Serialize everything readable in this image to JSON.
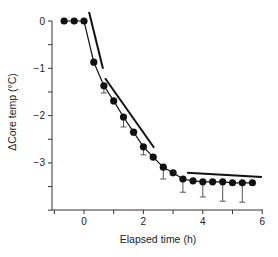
{
  "chart_data": {
    "type": "line",
    "title": "",
    "xlabel": "Elapsed time (h)",
    "ylabel": "ΔCore temp (°C)",
    "xlim": [
      -1,
      6
    ],
    "ylim": [
      -4,
      0.1
    ],
    "x_ticks": [
      -1,
      0,
      1,
      2,
      3,
      4,
      5,
      6
    ],
    "x_tick_labels": [
      "",
      "0",
      "",
      "2",
      "",
      "4",
      "",
      "6"
    ],
    "y_ticks": [
      0,
      -0.5,
      -1,
      -1.5,
      -2,
      -2.5,
      -3,
      -3.5,
      -4
    ],
    "y_tick_labels": [
      "0",
      "",
      "-1",
      "",
      "-2",
      "",
      "-3",
      "",
      ""
    ],
    "grid": false,
    "legend": null,
    "series": [
      {
        "name": "Core temperature change",
        "marker": "filled-circle",
        "x": [
          -0.67,
          -0.33,
          0,
          0.33,
          0.67,
          1.0,
          1.33,
          1.67,
          2.0,
          2.33,
          2.67,
          3.0,
          3.33,
          3.67,
          4.0,
          4.33,
          4.67,
          5.0,
          5.33,
          5.67
        ],
        "values": [
          0,
          0,
          0,
          -0.87,
          -1.37,
          -1.69,
          -2.03,
          -2.35,
          -2.66,
          -2.88,
          -3.09,
          -3.21,
          -3.34,
          -3.38,
          -3.4,
          -3.4,
          -3.4,
          -3.42,
          -3.42,
          -3.42
        ],
        "error_lower": [
          0,
          0,
          0,
          0,
          0.15,
          0,
          0.21,
          0,
          0.17,
          0,
          0.25,
          0,
          0.28,
          0,
          0.32,
          0,
          0.41,
          0,
          0.41,
          0
        ]
      }
    ],
    "annotations": [
      {
        "type": "fit-line",
        "phase": 1,
        "x": [
          0.17,
          0.64
        ],
        "y": [
          0.19,
          -1.01
        ]
      },
      {
        "type": "fit-line",
        "phase": 2,
        "x": [
          0.71,
          2.36
        ],
        "y": [
          -1.21,
          -2.68
        ]
      },
      {
        "type": "fit-line",
        "phase": 3,
        "x": [
          3.47,
          5.99
        ],
        "y": [
          -3.21,
          -3.3
        ]
      }
    ]
  },
  "layout": {
    "x_axis_y_px": 210,
    "y_axis_x_px": 52,
    "x0_px": 84,
    "px_per_hour": 29.7,
    "y0_px": 21,
    "px_per_degree": 47.3,
    "x_axis_left_px": 54,
    "x_axis_right_px": 263
  }
}
